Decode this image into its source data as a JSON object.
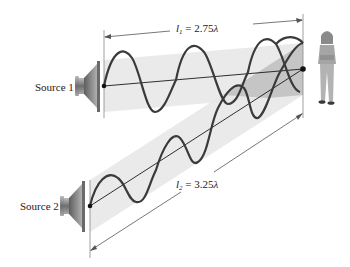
{
  "diagram": {
    "source1": {
      "label": "Source 1"
    },
    "source2": {
      "label": "Source 2"
    },
    "path1": {
      "var": "l",
      "sub": "1",
      "eq": " = 2.75",
      "unit": "λ"
    },
    "path2": {
      "var": "l",
      "sub": "2",
      "eq": " = 3.25",
      "unit": "λ"
    },
    "listener": {
      "label": "listener"
    },
    "colors": {
      "beam": "#e6e6e6",
      "beam_overlap": "#b8b8b8",
      "wave": "#3a3a3a",
      "line": "#1a1a1a",
      "dim_line": "#555555",
      "speaker": "#7a7a7a"
    }
  }
}
